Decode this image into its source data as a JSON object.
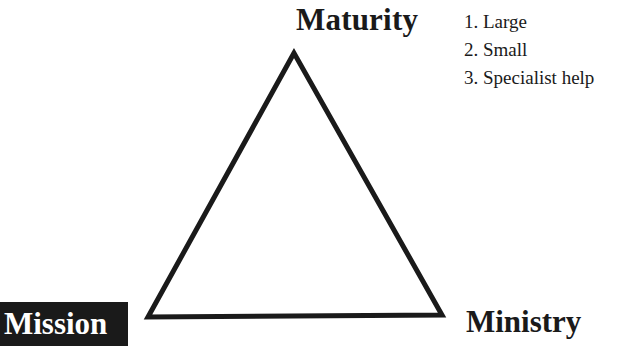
{
  "diagram": {
    "type": "triangle",
    "vertices": {
      "top": {
        "label": "Maturity",
        "x": 294,
        "y": 53
      },
      "bottom_left": {
        "label": "Mission",
        "x": 148,
        "y": 317,
        "highlighted": true
      },
      "bottom_right": {
        "label": "Ministry",
        "x": 442,
        "y": 315
      }
    },
    "stroke_color": "#1a1a1a",
    "highlight_bg": "#1a1a1a",
    "list": [
      {
        "label": "1. Large"
      },
      {
        "label": "2. Small"
      },
      {
        "label": "3. Specialist help"
      }
    ]
  }
}
